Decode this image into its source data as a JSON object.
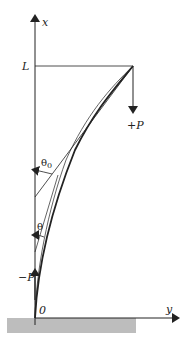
{
  "diagram": {
    "axes": {
      "vertical_label": "x",
      "horizontal_label": "y",
      "origin_label": "0",
      "length_label": "L"
    },
    "loads": {
      "positive": "+P",
      "negative": "−P"
    },
    "angles": {
      "tip_angle": "θ",
      "tip_angle_sub": "0",
      "general_angle": "θ"
    },
    "colors": {
      "line": "#222222",
      "ground": "#bdbdbd"
    }
  }
}
